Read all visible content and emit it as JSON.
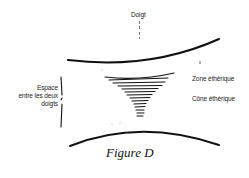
{
  "figure": {
    "caption": "Figure D",
    "labels": {
      "finger": "Doigt",
      "etheric_zone": "Zone éthérique",
      "etheric_cone": "Cône éthérique",
      "space_between_fingers": {
        "line1": "Espace",
        "line2": "entre les deux",
        "line3": "doigts"
      }
    },
    "colors": {
      "ink": "#1a1a1a",
      "background": "#ffffff"
    }
  }
}
